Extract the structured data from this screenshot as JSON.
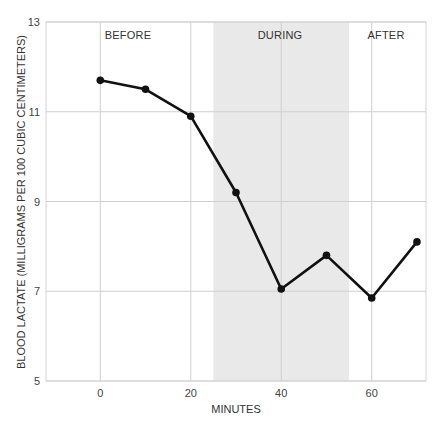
{
  "chart_data": {
    "type": "line",
    "title": "",
    "xlabel": "MINUTES",
    "ylabel": "BLOOD LACTATE (MILLIGRAMS PER 100 CUBIC CENTIMETERS)",
    "xlim": [
      -12,
      72
    ],
    "ylim": [
      5,
      13
    ],
    "x_ticks": [
      0,
      20,
      40,
      60
    ],
    "y_ticks": [
      5,
      7,
      9,
      11,
      13
    ],
    "grid": true,
    "legend": null,
    "series": [
      {
        "name": "Blood lactate",
        "x": [
          0,
          10,
          20,
          30,
          40,
          50,
          60,
          70
        ],
        "values": [
          11.7,
          11.5,
          10.9,
          9.2,
          7.05,
          7.8,
          6.85,
          8.1
        ]
      }
    ],
    "regions": [
      {
        "label": "BEFORE",
        "x_start": -12,
        "x_end": 25,
        "shaded": false
      },
      {
        "label": "DURING",
        "x_start": 25,
        "x_end": 55,
        "shaded": true
      },
      {
        "label": "AFTER",
        "x_start": 55,
        "x_end": 72,
        "shaded": false
      }
    ]
  },
  "colors": {
    "line": "#111111",
    "grid": "#cfcfcf",
    "frame": "#d4d4d4",
    "shade": "#e9e9e9",
    "text": "#333333"
  }
}
